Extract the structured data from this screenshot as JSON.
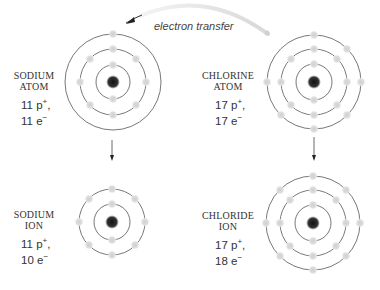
{
  "transfer_label": "electron transfer",
  "colors": {
    "orbit": "#555555",
    "electron": "#d4d4d4",
    "nucleus": "#222222",
    "arrow": "#333333",
    "transfer_arc": "#e6e6e6"
  },
  "panels": [
    {
      "id": "sodium-atom",
      "name_line1": "SODIUM",
      "name_line2": "ATOM",
      "protons": "11 p",
      "proton_sign": "+",
      "electrons": "11 e",
      "electron_sign": "−",
      "shells": [
        2,
        8,
        1
      ]
    },
    {
      "id": "chlorine-atom",
      "name_line1": "CHLORINE",
      "name_line2": "ATOM",
      "protons": "17 p",
      "proton_sign": "+",
      "electrons": "17 e",
      "electron_sign": "−",
      "shells": [
        2,
        8,
        7
      ]
    },
    {
      "id": "sodium-ion",
      "name_line1": "SODIUM",
      "name_line2": "ION",
      "protons": "11 p",
      "proton_sign": "+",
      "electrons": "10 e",
      "electron_sign": "−",
      "shells": [
        2,
        8
      ]
    },
    {
      "id": "chloride-ion",
      "name_line1": "CHLORIDE",
      "name_line2": "ION",
      "protons": "17 p",
      "proton_sign": "+",
      "electrons": "18 e",
      "electron_sign": "−",
      "shells": [
        2,
        8,
        8
      ]
    }
  ]
}
